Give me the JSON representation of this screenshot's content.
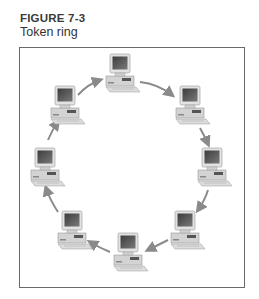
{
  "figure": {
    "number": "FIGURE 7-3",
    "caption": "Token ring"
  },
  "diagram": {
    "type": "token-ring-network",
    "direction": "clockwise",
    "node_count": 8,
    "nodes": [
      {
        "id": "pc-top",
        "x": 120,
        "y": 68
      },
      {
        "id": "pc-upper-right",
        "x": 190,
        "y": 100
      },
      {
        "id": "pc-right",
        "x": 210,
        "y": 162
      },
      {
        "id": "pc-lower-right",
        "x": 185,
        "y": 225
      },
      {
        "id": "pc-bottom",
        "x": 128,
        "y": 245
      },
      {
        "id": "pc-lower-left",
        "x": 70,
        "y": 225
      },
      {
        "id": "pc-left",
        "x": 45,
        "y": 162
      },
      {
        "id": "pc-upper-left",
        "x": 65,
        "y": 100
      }
    ],
    "colors": {
      "frame": "#6a6a6a",
      "arrow": "#8a8a8a",
      "monitor_case": "#d9d9d9",
      "screen": "#555555",
      "base": "#cfcfcf"
    }
  }
}
